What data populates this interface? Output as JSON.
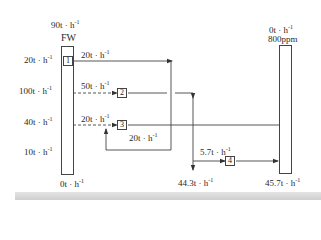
{
  "diagram": {
    "type": "water-network-flow",
    "source_column": {
      "label": "FW",
      "top_flow": "90t · h",
      "bottom_flow": "0t · h",
      "inflows": [
        {
          "label": "20t · h"
        },
        {
          "label": "100t · h"
        },
        {
          "label": "40t · h"
        },
        {
          "label": "10t · h"
        }
      ]
    },
    "sink_column": {
      "top_flow": "0t · h",
      "concentration": "800ppm",
      "bottom_flow": "45.7t · h"
    },
    "units": [
      {
        "id": "1",
        "flow_label": "20t · h"
      },
      {
        "id": "2",
        "flow_label": "50t · h"
      },
      {
        "id": "3",
        "flow_label": "20t · h",
        "recycle_label": "20t · h"
      },
      {
        "id": "4",
        "flow_label": "5.7t · h"
      }
    ],
    "outputs": {
      "wastewater": "44.3t · h"
    },
    "exponent": "-1",
    "colors": {
      "line": "#444444",
      "band": "#d6d6d6"
    }
  }
}
